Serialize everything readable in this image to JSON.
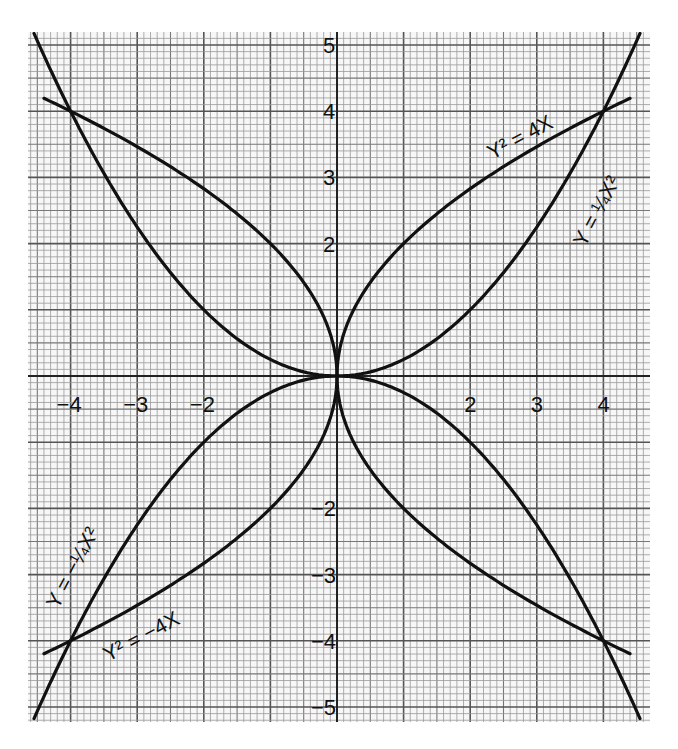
{
  "caption": "(the focus) to its directrix (L) which is the y-axis",
  "chart_data": {
    "type": "line",
    "title": "",
    "xlabel": "",
    "ylabel": "",
    "xlim": [
      -4.5,
      4.5
    ],
    "ylim": [
      -5.2,
      5.2
    ],
    "grid": true,
    "x_ticks": [
      "-4",
      "-3",
      "-2",
      "2",
      "3",
      "4"
    ],
    "y_ticks": [
      "5",
      "4",
      "3",
      "2",
      "-2",
      "-3",
      "-4",
      "-5"
    ],
    "series": [
      {
        "name": "y^2 = 4x",
        "equation": "y^2 = 4x",
        "points": [
          [
            0,
            0
          ],
          [
            1,
            2
          ],
          [
            4,
            4
          ],
          [
            4.5,
            4.24
          ]
        ]
      },
      {
        "name": "y = 1/4 x^2",
        "equation": "y = x^2/4",
        "points": [
          [
            0,
            0
          ],
          [
            2,
            1
          ],
          [
            4,
            4
          ],
          [
            4.5,
            5.06
          ]
        ]
      },
      {
        "name": "y^2 = -4x",
        "equation": "y^2 = -4x",
        "points": [
          [
            0,
            0
          ],
          [
            -1,
            -2
          ],
          [
            -4,
            -4
          ],
          [
            -4.5,
            -4.24
          ]
        ]
      },
      {
        "name": "y = -1/4 x^2",
        "equation": "y = -x^2/4",
        "points": [
          [
            0,
            0
          ],
          [
            -2,
            -1
          ],
          [
            -4,
            -4
          ],
          [
            -4.5,
            -5.06
          ]
        ]
      },
      {
        "name": "mirror curves",
        "equation": "y^2 = -4x (upper), y = x^2/4 (left), y^2 = 4x (lower), y = -x^2/4 (right)",
        "points": [
          [
            -4,
            4
          ],
          [
            4,
            -4
          ]
        ]
      }
    ],
    "annotations": [
      {
        "text": "y² = 4x",
        "near": [
          2.5,
          3.5
        ]
      },
      {
        "text": "y = ¼x²",
        "near": [
          3.8,
          2.8
        ]
      },
      {
        "text": "y = −¼x²",
        "near": [
          -4.0,
          -2.3
        ]
      },
      {
        "text": "y² = −4x",
        "near": [
          -2.8,
          -3.6
        ]
      }
    ],
    "intersections": [
      [
        0,
        0
      ],
      [
        4,
        4
      ],
      [
        -4,
        4
      ],
      [
        -4,
        -4
      ],
      [
        4,
        -4
      ]
    ]
  },
  "labels": {
    "l1": "Y² = 4X",
    "l2": "Y = ¼X²",
    "l3": "Y = −¼X²",
    "l4": "Y² = −4X"
  }
}
